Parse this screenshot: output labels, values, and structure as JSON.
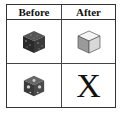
{
  "table": {
    "headers": [
      "Before",
      "After"
    ],
    "rows": [
      {
        "before": "dark-textured-cube-icon",
        "after": "plain-gray-cube-icon"
      },
      {
        "before": "perforated-textured-cube-icon",
        "after": "X"
      }
    ]
  }
}
